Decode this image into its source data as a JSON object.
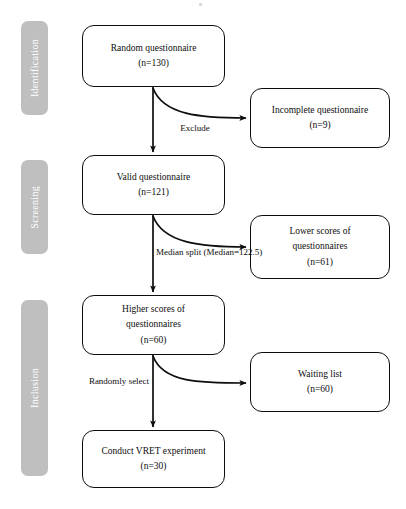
{
  "diagram": {
    "type": "flowchart",
    "stages": [
      {
        "id": "identification",
        "label": "Identification"
      },
      {
        "id": "screening",
        "label": "Screening"
      },
      {
        "id": "inclusion",
        "label": "Inclusion"
      }
    ],
    "nodes": [
      {
        "id": "random-questionnaire",
        "lines": [
          "Random questionnaire",
          "(n=130)"
        ],
        "n": 130
      },
      {
        "id": "incomplete-questionnaire",
        "lines": [
          "Incomplete questionnaire",
          "(n=9)"
        ],
        "n": 9
      },
      {
        "id": "valid-questionnaire",
        "lines": [
          "Valid questionnaire",
          "(n=121)"
        ],
        "n": 121
      },
      {
        "id": "lower-scores",
        "lines": [
          "Lower scores of",
          "questionnaires",
          "(n=61)"
        ],
        "n": 61
      },
      {
        "id": "higher-scores",
        "lines": [
          "Higher scores of",
          "questionnaires",
          "(n=60)"
        ],
        "n": 60
      },
      {
        "id": "waiting-list",
        "lines": [
          "Waiting list",
          "(n=60)"
        ],
        "n": 60
      },
      {
        "id": "conduct-vret",
        "lines": [
          "Conduct VRET experiment",
          "(n=30)"
        ],
        "n": 30
      }
    ],
    "edge_labels": [
      {
        "id": "exclude",
        "lines": [
          "Exclude"
        ]
      },
      {
        "id": "median-split",
        "lines": [
          "Median split",
          "(Median=122.5)"
        ],
        "median": 122.5
      },
      {
        "id": "randomly-select",
        "lines": [
          "Randomly",
          "select"
        ]
      }
    ],
    "colors": {
      "stage_bar": "#bfbfbf",
      "stage_text": "#ffffff",
      "node_border": "#0d0d0d",
      "node_fill": "#ffffff",
      "arrow": "#0d0d0d",
      "background": "#ffffff"
    }
  }
}
